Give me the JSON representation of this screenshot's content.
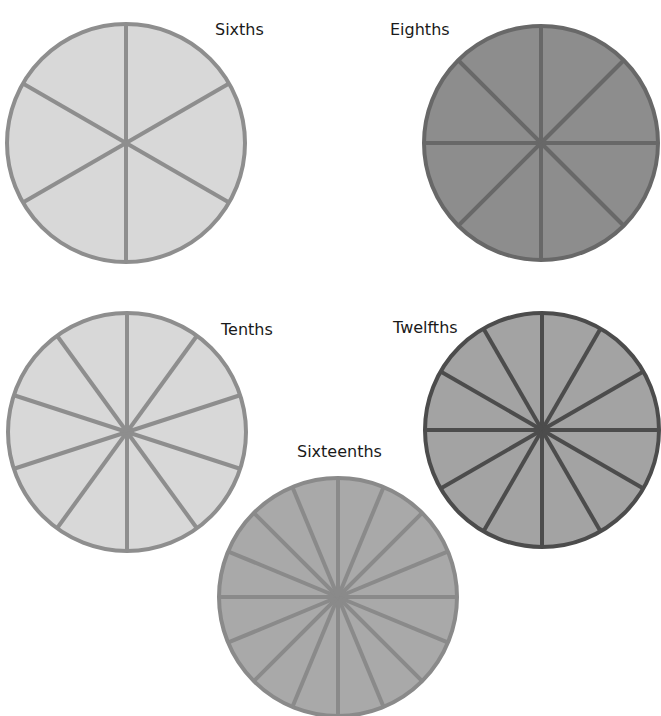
{
  "title_cutoff": "",
  "circles": [
    {
      "id": "sixths",
      "label": "Sixths",
      "segments": 6,
      "cx": 126,
      "cy": 143,
      "r": 119,
      "fill": "#d8d8d8",
      "stroke": "#8e8e8e",
      "label_x": 215,
      "label_y": 22
    },
    {
      "id": "eighths",
      "label": "Eighths",
      "segments": 8,
      "cx": 541,
      "cy": 143,
      "r": 117,
      "fill": "#8d8d8d",
      "stroke": "#686868",
      "label_x": 390,
      "label_y": 22
    },
    {
      "id": "tenths",
      "label": "Tenths",
      "segments": 10,
      "cx": 127,
      "cy": 432,
      "r": 119,
      "fill": "#d8d8d8",
      "stroke": "#8e8e8e",
      "label_x": 221,
      "label_y": 322
    },
    {
      "id": "twelfths",
      "label": "Twelfths",
      "segments": 12,
      "cx": 542,
      "cy": 430,
      "r": 117,
      "fill": "#a3a3a3",
      "stroke": "#4c4c4c",
      "label_x": 393,
      "label_y": 320
    },
    {
      "id": "sixteenths",
      "label": "Sixteenths",
      "segments": 16,
      "cx": 338,
      "cy": 597,
      "r": 119,
      "fill": "#a9a9a9",
      "stroke": "#8a8a8a",
      "label_x": 297,
      "label_y": 444
    }
  ]
}
